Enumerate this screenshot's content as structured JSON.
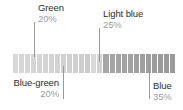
{
  "figure": {
    "type": "color-distribution-strip",
    "background": "#ffffff",
    "callouts": [
      {
        "id": "green",
        "name": "Green",
        "percent": "20%",
        "position": "top-left",
        "name_color": "#2e2e2e",
        "percent_color": "#a0a0a0",
        "leader_color": "#9a9a9a"
      },
      {
        "id": "light-blue",
        "name": "Light blue",
        "percent": "25%",
        "position": "top-right",
        "name_color": "#2e2e2e",
        "percent_color": "#a0a0a0",
        "leader_color": "#9a9a9a"
      },
      {
        "id": "blue-green",
        "name": "Blue-green",
        "percent": "20%",
        "position": "bottom-left",
        "name_color": "#2e2e2e",
        "percent_color": "#a0a0a0",
        "leader_color": "#9a9a9a"
      },
      {
        "id": "blue",
        "name": "Blue",
        "percent": "35%",
        "position": "bottom-right",
        "name_color": "#2e2e2e",
        "percent_color": "#a0a0a0",
        "leader_color": "#9a9a9a"
      }
    ]
  },
  "chart_data": {
    "type": "bar",
    "title": "",
    "xlabel": "",
    "ylabel": "",
    "grid": false,
    "legend": "annotations",
    "orientation": "horizontal-strip",
    "categories": [
      "Green",
      "Blue-green",
      "Light blue",
      "Blue"
    ],
    "values": [
      20,
      20,
      25,
      35
    ],
    "value_labels": [
      "20%",
      "25%",
      "20%",
      "35%"
    ],
    "units": "percent",
    "ylim": [
      0,
      100
    ],
    "annotations": [
      {
        "label": "Green",
        "value": 20,
        "value_label": "20%",
        "placement": "above-left"
      },
      {
        "label": "Light blue",
        "value": 25,
        "value_label": "25%",
        "placement": "above-right"
      },
      {
        "label": "Blue-green",
        "value": 20,
        "value_label": "20%",
        "placement": "below-left"
      },
      {
        "label": "Blue",
        "value": 35,
        "value_label": "35%",
        "placement": "below-right"
      }
    ],
    "segment_colors": [
      "#d8d8d8",
      "#d7d7d7",
      "#d6d6d6",
      "#d5d5d5",
      "#d4d4d4",
      "#d4d4d4",
      "#d3d3d3",
      "#d2d2d2",
      "#d1d1d1",
      "#d0d0d0",
      "#cfcfcf",
      "#cdcdcd",
      "#cbcbcb",
      "#d9d9d9",
      "#d2d2d2",
      "#a6a6a6",
      "#a4a4a4",
      "#a3a3a3",
      "#a2a2a2",
      "#a1a1a1",
      "#a0a0a0",
      "#9f9f9f",
      "#9e9e9e",
      "#9c9c9c",
      "#9b9b9b",
      "#9a9a9a",
      "#999999"
    ]
  }
}
